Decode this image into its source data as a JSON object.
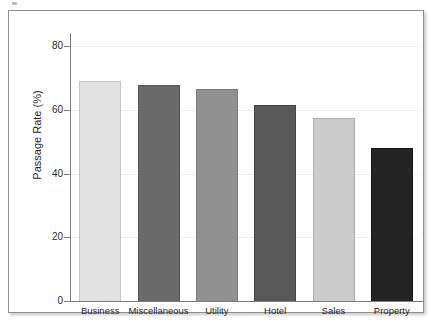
{
  "figure": {
    "background_color": "#ffffff",
    "frame_border_color": "#8e8e8e",
    "axis_color": "#7c7c7c",
    "gridline_color": "#ededed"
  },
  "chart_data": {
    "type": "bar",
    "title": "",
    "xlabel": "",
    "ylabel": "Passage Rate (%)",
    "categories": [
      "Business",
      "Miscellaneous",
      "Utility",
      "Hotel",
      "Sales",
      "Property"
    ],
    "values": [
      68.9,
      67.8,
      66.5,
      61.5,
      57.4,
      48.0
    ],
    "ylim": [
      0,
      85
    ],
    "yticks": [
      0,
      20,
      40,
      60,
      80
    ],
    "ytick_labels": [
      "0",
      "20",
      "40",
      "60",
      "80"
    ],
    "grid": "horizontal",
    "legend": "none",
    "bar_colors": [
      "#e2e2e2",
      "#6a6a6a",
      "#919191",
      "#595959",
      "#cbcbcb",
      "#242424"
    ],
    "bar_edge_colors": [
      "#c4c4c4",
      "#545454",
      "#7b7b7b",
      "#454545",
      "#b0b0b0",
      "#141414"
    ]
  }
}
